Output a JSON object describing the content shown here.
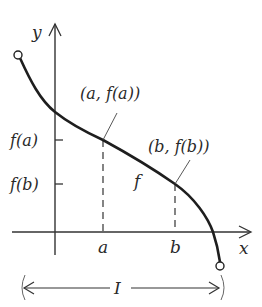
{
  "diagram": {
    "axes": {
      "x_label": "x",
      "y_label": "y"
    },
    "y_ticks": [
      {
        "label": "f(a)",
        "y": 140
      },
      {
        "label": "f(b)",
        "y": 184
      }
    ],
    "x_ticks": [
      {
        "label": "a",
        "x": 103
      },
      {
        "label": "b",
        "x": 175
      }
    ],
    "points": [
      {
        "label": "(a, f(a))"
      },
      {
        "label": "(b, f(b))"
      }
    ],
    "function_label": "f",
    "interval_label": "I",
    "endpoints": {
      "left": "open",
      "right": "open"
    },
    "colors": {
      "stroke": "#2a2a2a",
      "background": "#ffffff"
    }
  }
}
